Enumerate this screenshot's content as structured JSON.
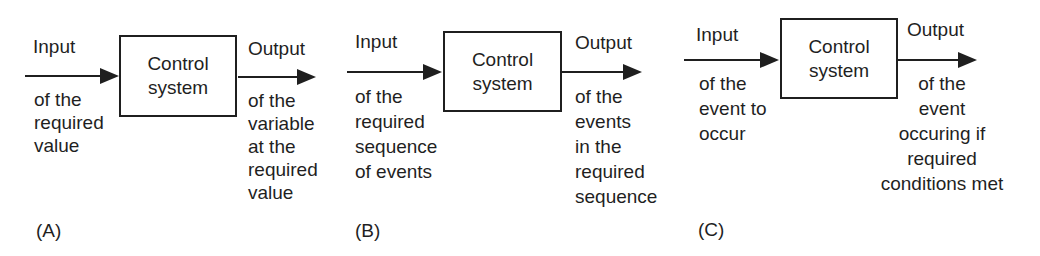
{
  "figure": {
    "description_labels": {
      "input": "Input",
      "output": "Output"
    },
    "colors": {
      "ink": "#1f1f1f",
      "background": "#ffffff"
    },
    "diagrams": [
      {
        "id": "A",
        "label": "(A)",
        "input_title": "Input",
        "input_desc": "of the\nrequired\nvalue",
        "box_label": "Control\nsystem",
        "output_title": "Output",
        "output_desc": "of the\nvariable\nat the\nrequired\nvalue"
      },
      {
        "id": "B",
        "label": "(B)",
        "input_title": "Input",
        "input_desc": "of the\nrequired\nsequence\nof events",
        "box_label": "Control\nsystem",
        "output_title": "Output",
        "output_desc": "of the\nevents\nin the\nrequired\nsequence"
      },
      {
        "id": "C",
        "label": "(C)",
        "input_title": "Input",
        "input_desc": "of the\nevent to\noccur",
        "box_label": "Control\nsystem",
        "output_title": "Output",
        "output_desc": "of the\nevent\noccuring if\nrequired\nconditions met"
      }
    ]
  }
}
